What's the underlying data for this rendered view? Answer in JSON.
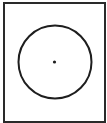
{
  "diagram": {
    "type": "circle-with-center-point",
    "frame": {
      "stroke": "#2a2a2a"
    },
    "circle": {
      "cx": 55,
      "cy": 62,
      "r": 36.5,
      "stroke": "#1e1e1e",
      "stroke_width": 2
    },
    "center_point": {
      "cx": 54.5,
      "cy": 62,
      "r": 1.6,
      "fill": "#1e1e1e"
    }
  }
}
